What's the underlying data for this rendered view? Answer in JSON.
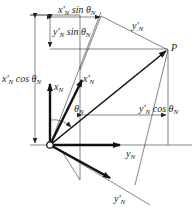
{
  "diagram": {
    "type": "vector-rotation",
    "point_label": "P",
    "axes": {
      "x": "x_N",
      "y": "y_N",
      "x_rot": "x'_N",
      "y_rot": "y'_N"
    },
    "angle": "θ_N",
    "dimensions": {
      "top": "x'_N sin θ_N",
      "upper_inner": "y'_N sin θ_N",
      "left": "x'_N cos θ_N",
      "right": "y'_N cos θ_N"
    },
    "colors": {
      "line": "#222222",
      "background": "#ffffff"
    }
  }
}
